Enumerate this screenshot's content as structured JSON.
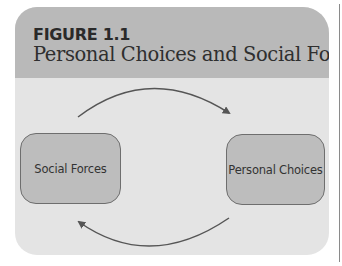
{
  "figure": {
    "label": "FIGURE 1.1",
    "title": "Personal Choices and Social Forces"
  },
  "diagram": {
    "nodes": [
      {
        "id": "social-forces",
        "label": "Social Forces"
      },
      {
        "id": "personal-choices",
        "label": "Personal Choices"
      }
    ],
    "edges": [
      {
        "from": "social-forces",
        "to": "personal-choices",
        "position": "top"
      },
      {
        "from": "personal-choices",
        "to": "social-forces",
        "position": "bottom"
      }
    ]
  },
  "colors": {
    "header_bg": "#b9b9b9",
    "body_bg": "#e4e4e4",
    "node_bg": "#bdbdbd",
    "node_border": "#6e6e6e",
    "arrow": "#555555"
  }
}
